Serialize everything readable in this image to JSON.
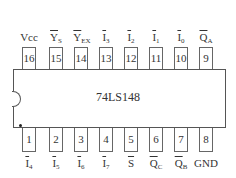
{
  "chip": {
    "name": "74LS148",
    "description": "8-line to 3-line priority encoder, DIP-16 pinout"
  },
  "top_pins": [
    {
      "number": "16",
      "label": "Vcc",
      "main": "Vcc",
      "sub": "",
      "overbar": false
    },
    {
      "number": "15",
      "label": "Y_S (active low)",
      "main": "Y",
      "sub": "S",
      "overbar": true
    },
    {
      "number": "14",
      "label": "Y_EX (active low)",
      "main": "Y",
      "sub": "EX",
      "overbar": true
    },
    {
      "number": "13",
      "label": "I_3 (active low)",
      "main": "I",
      "sub": "3",
      "overbar": true
    },
    {
      "number": "12",
      "label": "I_2 (active low)",
      "main": "I",
      "sub": "2",
      "overbar": true
    },
    {
      "number": "11",
      "label": "I_1 (active low)",
      "main": "I",
      "sub": "1",
      "overbar": true
    },
    {
      "number": "10",
      "label": "I_0 (active low)",
      "main": "I",
      "sub": "0",
      "overbar": true
    },
    {
      "number": "9",
      "label": "Q_A (active low)",
      "main": "Q",
      "sub": "A",
      "overbar": true
    }
  ],
  "bottom_pins": [
    {
      "number": "1",
      "label": "I_4 (active low)",
      "main": "I",
      "sub": "4",
      "overbar": true
    },
    {
      "number": "2",
      "label": "I_5 (active low)",
      "main": "I",
      "sub": "5",
      "overbar": true
    },
    {
      "number": "3",
      "label": "I_6 (active low)",
      "main": "I",
      "sub": "6",
      "overbar": true
    },
    {
      "number": "4",
      "label": "I_7 (active low)",
      "main": "I",
      "sub": "7",
      "overbar": true
    },
    {
      "number": "5",
      "label": "S (active low)",
      "main": "S",
      "sub": "",
      "overbar": true
    },
    {
      "number": "6",
      "label": "Q_C (active low)",
      "main": "Q",
      "sub": "C",
      "overbar": true
    },
    {
      "number": "7",
      "label": "Q_B (active low)",
      "main": "Q",
      "sub": "B",
      "overbar": true
    },
    {
      "number": "8",
      "label": "GND",
      "main": "GND",
      "sub": "",
      "overbar": false
    }
  ]
}
